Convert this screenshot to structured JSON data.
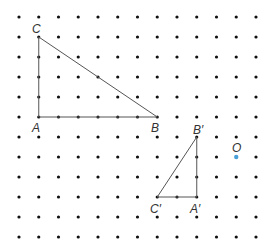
{
  "grid": {
    "cols": 13,
    "rows": 12,
    "origin_x": 19,
    "origin_y": 17,
    "spacing_x": 19.75,
    "spacing_y": 20,
    "dot_color": "#111111",
    "dot_radius": 1.6
  },
  "triangle_original": {
    "vertices": [
      {
        "name": "A",
        "label": "A",
        "col": 1,
        "row": 5
      },
      {
        "name": "B",
        "label": "B",
        "col": 7,
        "row": 5
      },
      {
        "name": "C",
        "label": "C",
        "col": 1,
        "row": 1
      }
    ]
  },
  "triangle_image": {
    "vertices": [
      {
        "name": "A_prime",
        "label": "A′",
        "col": 9,
        "row": 9
      },
      {
        "name": "B_prime",
        "label": "B′",
        "col": 9,
        "row": 6
      },
      {
        "name": "C_prime",
        "label": "C′",
        "col": 7,
        "row": 9
      }
    ]
  },
  "center": {
    "label": "O",
    "col": 11,
    "row": 7,
    "color": "#4a9fd8"
  },
  "labels": {
    "A": "A",
    "B": "B",
    "C": "C",
    "A_prime": "A′",
    "B_prime": "B′",
    "C_prime": "C′",
    "O": "O"
  },
  "line_color": "#555555"
}
